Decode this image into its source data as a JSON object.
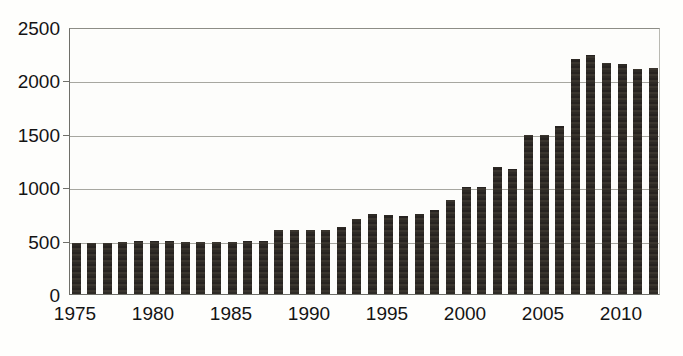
{
  "chart_data": {
    "type": "bar",
    "title": "",
    "subtitle": "",
    "xlabel": "",
    "ylabel": "",
    "xlim": [
      1974.5,
      2012.5
    ],
    "ylim": [
      0,
      2500
    ],
    "grid": true,
    "legend": false,
    "y_ticks": [
      0,
      500,
      1000,
      1500,
      2000,
      2500
    ],
    "y_tick_labels": [
      "0",
      "500",
      "1000",
      "1500",
      "2000",
      "2500"
    ],
    "x_ticks": [
      1975,
      1980,
      1985,
      1990,
      1995,
      2000,
      2005,
      2010
    ],
    "x_tick_labels": [
      "1975",
      "1980",
      "1985",
      "1990",
      "1995",
      "2000",
      "2005",
      "2010"
    ],
    "bar_color": "#312c27",
    "grid_color": "#a7a7a0",
    "axis_color": "#6f6f69",
    "background_color": "#fdfdfb",
    "categories": [
      1975,
      1976,
      1977,
      1978,
      1979,
      1980,
      1981,
      1982,
      1983,
      1984,
      1985,
      1986,
      1987,
      1988,
      1989,
      1990,
      1991,
      1992,
      1993,
      1994,
      1995,
      1996,
      1997,
      1998,
      1999,
      2000,
      2001,
      2002,
      2003,
      2004,
      2005,
      2006,
      2007,
      2008,
      2009,
      2010,
      2011,
      2012
    ],
    "values": [
      480,
      480,
      480,
      490,
      500,
      500,
      500,
      490,
      490,
      490,
      490,
      500,
      500,
      600,
      600,
      600,
      600,
      630,
      700,
      750,
      740,
      730,
      750,
      790,
      880,
      1000,
      1000,
      1190,
      1170,
      1490,
      1490,
      1570,
      2200,
      2240,
      2160,
      2150,
      2110,
      2120
    ]
  }
}
